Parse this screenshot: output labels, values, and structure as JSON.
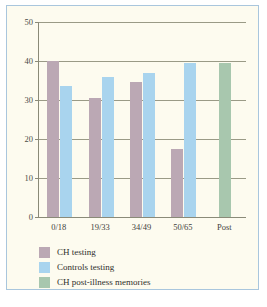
{
  "chart_data": {
    "type": "bar",
    "title": "",
    "xlabel": "",
    "ylabel": "",
    "categories": [
      "0/18",
      "19/33",
      "34/49",
      "50/65",
      "Post"
    ],
    "ylim": [
      0,
      50
    ],
    "yticks": [
      0,
      10,
      20,
      30,
      40,
      50
    ],
    "ytick_labels": [
      "0",
      "10",
      "20",
      "30",
      "40",
      "50"
    ],
    "grid": true,
    "legend_position": "below-axes-left",
    "series": [
      {
        "name": "CH testing",
        "color": "#bba8b4",
        "values": [
          40,
          30.5,
          34.5,
          17.5,
          null
        ]
      },
      {
        "name": "Controls testing",
        "color": "#a9d4ee",
        "values": [
          33.5,
          36,
          37,
          39.5,
          null
        ]
      },
      {
        "name": "CH post-illness memories",
        "color": "#a8c7ae",
        "values": [
          null,
          null,
          null,
          null,
          39.5
        ]
      }
    ]
  },
  "axis": {
    "ytick_labels": [
      "50",
      "40",
      "30",
      "20",
      "10",
      "0"
    ],
    "xtick_labels": [
      "0/18",
      "19/33",
      "34/49",
      "50/65",
      "Post"
    ]
  },
  "legend": {
    "items": [
      {
        "label": "CH testing",
        "color": "#bba8b4"
      },
      {
        "label": "Controls testing",
        "color": "#a9d4ee"
      },
      {
        "label": "CH post-illness memories",
        "color": "#a8c7ae"
      }
    ]
  },
  "colors": {
    "background": "#fdfbef",
    "frame_border": "#a9c6dd",
    "axis_line": "#8a8a78",
    "gridline": "#9a9a86",
    "ch_testing": "#bba8b4",
    "controls_testing": "#a9d4ee",
    "ch_post_illness": "#a8c7ae"
  }
}
